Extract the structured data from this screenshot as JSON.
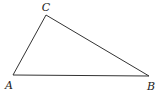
{
  "diagram": {
    "type": "triangle",
    "vertices": [
      {
        "label": "A",
        "x": 13,
        "y": 75,
        "lx": 9,
        "ly": 89
      },
      {
        "label": "B",
        "x": 149,
        "y": 76,
        "lx": 151,
        "ly": 90
      },
      {
        "label": "C",
        "x": 46,
        "y": 15,
        "lx": 46,
        "ly": 11
      }
    ],
    "edges": [
      [
        "A",
        "B"
      ],
      [
        "B",
        "C"
      ],
      [
        "C",
        "A"
      ]
    ]
  }
}
